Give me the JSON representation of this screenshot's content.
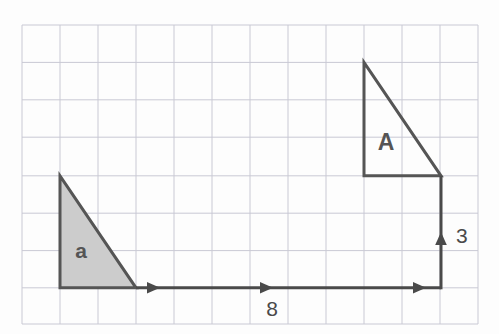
{
  "figure": {
    "background_color": "#fdfdfd",
    "grid": {
      "color": "#c9c9d4",
      "border_color": "#bfbfcc",
      "columns": 12,
      "rows": 8,
      "x0": 22,
      "y0": 25,
      "cell_w": 38,
      "cell_h": 37.4
    },
    "shapes": [
      {
        "name": "small-triangle",
        "label": "a",
        "fill": "#cccccc",
        "stroke": "#555555",
        "stroke_width": 3,
        "points": "60,175.8 60,287.8 136,287.8",
        "label_x": 81,
        "label_y": 258,
        "label_size": 21
      },
      {
        "name": "large-triangle",
        "label": "A",
        "fill": "none",
        "stroke": "#555555",
        "stroke_width": 3,
        "points": "364,62.4 364,175.8 441,175.8",
        "label_x": 386,
        "label_y": 150,
        "label_size": 23
      }
    ],
    "vectors": [
      {
        "name": "horizontal-translation-vector",
        "label": "8",
        "x1": 136,
        "y1": 287.8,
        "x2": 441,
        "y2": 287.8,
        "stroke": "#4a4a4a",
        "stroke_width": 3,
        "arrow_positions": [
          155,
          268,
          421
        ],
        "label_x": 272,
        "label_y": 316,
        "label_size": 21
      },
      {
        "name": "vertical-translation-vector",
        "label": "3",
        "x1": 441,
        "y1": 287.8,
        "x2": 441,
        "y2": 175.8,
        "stroke": "#4a4a4a",
        "stroke_width": 3,
        "arrow_positions": [
          236
        ],
        "label_x": 456,
        "label_y": 243,
        "label_size": 21
      }
    ]
  }
}
